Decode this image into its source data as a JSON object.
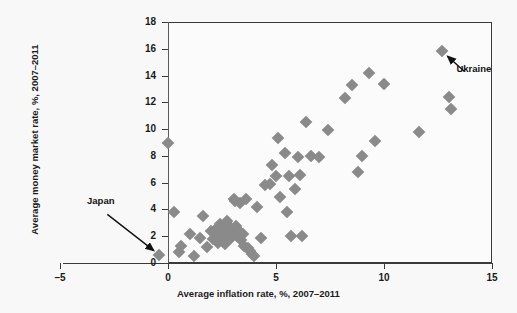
{
  "chart_data": {
    "type": "scatter",
    "title": "",
    "xlabel": "Average inflation rate, %, 2007–2011",
    "ylabel": "Average money market rate, %, 2007–2011",
    "xlim": [
      -5,
      15
    ],
    "ylim": [
      0,
      18
    ],
    "xticks": [
      -5,
      0,
      5,
      10,
      15
    ],
    "xtick_labels": [
      "–5",
      "0",
      "5",
      "10",
      "15"
    ],
    "yticks": [
      0,
      2,
      4,
      6,
      8,
      10,
      12,
      14,
      16,
      18
    ],
    "ytick_labels": [
      "0",
      "2",
      "4",
      "6",
      "8",
      "10",
      "12",
      "14",
      "16",
      "18"
    ],
    "grid": false,
    "legend": false,
    "marker_shape": "diamond",
    "marker_color": "#8a8a8a",
    "reference_lines": [
      {
        "orientation": "vertical",
        "value": 0,
        "color": "#5a5a5a"
      }
    ],
    "annotations": [
      {
        "label": "Japan",
        "target_x": -0.4,
        "target_y": 0.6,
        "label_x": -3.1,
        "label_y": 4.0
      },
      {
        "label": "Ukraine",
        "target_x": 12.7,
        "target_y": 15.8,
        "label_x": 14.0,
        "label_y": 13.9
      }
    ],
    "points": [
      {
        "x": -0.4,
        "y": 0.6
      },
      {
        "x": 0.0,
        "y": 9.0
      },
      {
        "x": 0.3,
        "y": 3.8
      },
      {
        "x": 0.5,
        "y": 0.8
      },
      {
        "x": 0.6,
        "y": 1.3
      },
      {
        "x": 1.0,
        "y": 2.2
      },
      {
        "x": 1.2,
        "y": 0.5
      },
      {
        "x": 1.5,
        "y": 1.9
      },
      {
        "x": 1.6,
        "y": 3.5
      },
      {
        "x": 1.8,
        "y": 1.2
      },
      {
        "x": 2.0,
        "y": 2.4
      },
      {
        "x": 2.1,
        "y": 1.8
      },
      {
        "x": 2.2,
        "y": 2.0
      },
      {
        "x": 2.25,
        "y": 2.6
      },
      {
        "x": 2.3,
        "y": 1.5
      },
      {
        "x": 2.35,
        "y": 2.2
      },
      {
        "x": 2.4,
        "y": 2.9
      },
      {
        "x": 2.45,
        "y": 1.7
      },
      {
        "x": 2.5,
        "y": 2.3
      },
      {
        "x": 2.55,
        "y": 2.0
      },
      {
        "x": 2.6,
        "y": 2.6
      },
      {
        "x": 2.65,
        "y": 1.4
      },
      {
        "x": 2.7,
        "y": 2.4
      },
      {
        "x": 2.75,
        "y": 3.1
      },
      {
        "x": 2.8,
        "y": 2.1
      },
      {
        "x": 2.85,
        "y": 2.7
      },
      {
        "x": 2.9,
        "y": 1.9
      },
      {
        "x": 2.95,
        "y": 2.5
      },
      {
        "x": 3.0,
        "y": 2.2
      },
      {
        "x": 3.05,
        "y": 4.8
      },
      {
        "x": 3.1,
        "y": 4.6
      },
      {
        "x": 3.15,
        "y": 2.8
      },
      {
        "x": 3.2,
        "y": 2.0
      },
      {
        "x": 3.3,
        "y": 2.4
      },
      {
        "x": 3.35,
        "y": 4.5
      },
      {
        "x": 3.4,
        "y": 1.7
      },
      {
        "x": 3.45,
        "y": 2.2
      },
      {
        "x": 3.5,
        "y": 1.3
      },
      {
        "x": 3.6,
        "y": 4.8
      },
      {
        "x": 3.7,
        "y": 1.1
      },
      {
        "x": 3.8,
        "y": 0.9
      },
      {
        "x": 3.9,
        "y": 0.7
      },
      {
        "x": 4.0,
        "y": 0.5
      },
      {
        "x": 4.1,
        "y": 4.2
      },
      {
        "x": 4.3,
        "y": 1.9
      },
      {
        "x": 4.5,
        "y": 5.8
      },
      {
        "x": 4.7,
        "y": 5.9
      },
      {
        "x": 4.8,
        "y": 7.3
      },
      {
        "x": 5.0,
        "y": 6.5
      },
      {
        "x": 5.1,
        "y": 9.3
      },
      {
        "x": 5.2,
        "y": 4.9
      },
      {
        "x": 5.4,
        "y": 8.2
      },
      {
        "x": 5.5,
        "y": 3.8
      },
      {
        "x": 5.6,
        "y": 6.5
      },
      {
        "x": 5.7,
        "y": 2.0
      },
      {
        "x": 5.9,
        "y": 5.5
      },
      {
        "x": 6.0,
        "y": 7.9
      },
      {
        "x": 6.1,
        "y": 6.6
      },
      {
        "x": 6.2,
        "y": 2.0
      },
      {
        "x": 6.4,
        "y": 10.5
      },
      {
        "x": 6.6,
        "y": 8.0
      },
      {
        "x": 7.0,
        "y": 7.9
      },
      {
        "x": 7.4,
        "y": 9.9
      },
      {
        "x": 8.2,
        "y": 12.3
      },
      {
        "x": 8.5,
        "y": 13.3
      },
      {
        "x": 8.8,
        "y": 6.8
      },
      {
        "x": 9.0,
        "y": 8.0
      },
      {
        "x": 9.3,
        "y": 14.2
      },
      {
        "x": 9.6,
        "y": 9.1
      },
      {
        "x": 10.0,
        "y": 13.4
      },
      {
        "x": 11.6,
        "y": 9.8
      },
      {
        "x": 12.7,
        "y": 15.8
      },
      {
        "x": 13.0,
        "y": 12.4
      },
      {
        "x": 13.1,
        "y": 11.5
      }
    ]
  }
}
